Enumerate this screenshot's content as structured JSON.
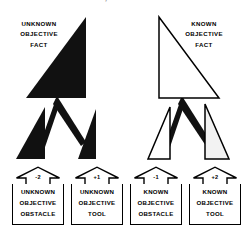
{
  "title": {
    "text": "OBJECTIVE FACTS, OBSTACLES AND TOOLS",
    "cut_off": true
  },
  "colors": {
    "solid_fill": "#111111",
    "outline": "#000000",
    "tinted_fill": "#f2f2f2",
    "background": "#ffffff"
  },
  "branches": {
    "unknown_side": {
      "fact": {
        "label_lines": [
          "UNKNOWN",
          "OBJECTIVE",
          "FACT"
        ],
        "style": "solid-black-triangle",
        "apex": "top-right"
      },
      "children": [
        {
          "value": "-2",
          "label_lines": [
            "UNKNOWN",
            "OBJECTIVE",
            "OBSTACLE"
          ],
          "shape_style": "solid-black-triangle",
          "shape_apex": "top-right"
        },
        {
          "value": "+1",
          "label_lines": [
            "UNKNOWN",
            "OBJECTIVE",
            "TOOL"
          ],
          "shape_style": "solid-black-triangle",
          "shape_apex": "top-right"
        }
      ]
    },
    "known_side": {
      "fact": {
        "label_lines": [
          "KNOWN",
          "OBJECTIVE",
          "FACT"
        ],
        "style": "outline-triangle",
        "apex": "top-left"
      },
      "children": [
        {
          "value": "-1",
          "label_lines": [
            "KNOWN",
            "OBJECTIVE",
            "OBSTACLE"
          ],
          "shape_style": "outline-triangle",
          "shape_apex": "top-right"
        },
        {
          "value": "+2",
          "label_lines": [
            "KNOWN",
            "OBJECTIVE",
            "TOOL"
          ],
          "shape_style": "outline-triangle-tinted",
          "shape_apex": "top-right"
        }
      ]
    }
  }
}
